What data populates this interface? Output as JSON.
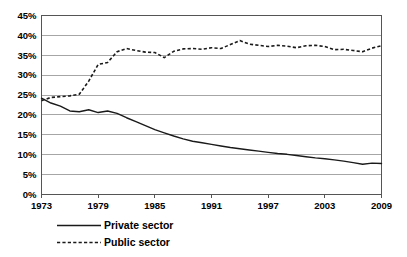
{
  "chart_data": {
    "type": "line",
    "title": "",
    "subtitle": "",
    "xlabel": "",
    "ylabel": "",
    "xlim": [
      1973,
      2009
    ],
    "ylim": [
      0,
      45
    ],
    "grid": "horizontal",
    "legend_position": "bottom-left",
    "y_ticks": [
      0,
      5,
      10,
      15,
      20,
      25,
      30,
      35,
      40,
      45
    ],
    "y_tick_labels": [
      "0%",
      "5%",
      "10%",
      "15%",
      "20%",
      "25%",
      "30%",
      "35%",
      "40%",
      "45%"
    ],
    "x_ticks": [
      1973,
      1979,
      1985,
      1991,
      1997,
      2003,
      2009
    ],
    "x_tick_labels": [
      "1973",
      "1979",
      "1985",
      "1991",
      "1997",
      "2003",
      "2009"
    ],
    "x": [
      1973,
      1974,
      1975,
      1976,
      1977,
      1978,
      1979,
      1980,
      1981,
      1982,
      1983,
      1984,
      1985,
      1986,
      1987,
      1988,
      1989,
      1990,
      1991,
      1992,
      1993,
      1994,
      1995,
      1996,
      1997,
      1998,
      1999,
      2000,
      2001,
      2002,
      2003,
      2004,
      2005,
      2006,
      2007,
      2008,
      2009
    ],
    "series": [
      {
        "name": "Private sector",
        "style": "solid",
        "color": "#1a1a1a",
        "values": [
          24.2,
          23.0,
          22.2,
          21.0,
          20.8,
          21.3,
          20.6,
          21.0,
          20.4,
          19.3,
          18.3,
          17.3,
          16.3,
          15.5,
          14.7,
          14.0,
          13.4,
          13.0,
          12.6,
          12.2,
          11.8,
          11.5,
          11.2,
          10.9,
          10.6,
          10.3,
          10.1,
          9.8,
          9.5,
          9.2,
          9.0,
          8.7,
          8.4,
          8.0,
          7.6,
          7.9,
          7.8
        ]
      },
      {
        "name": "Public sector",
        "style": "dashed",
        "color": "#1a1a1a",
        "values": [
          23.6,
          24.4,
          24.6,
          24.8,
          25.2,
          28.5,
          32.7,
          33.2,
          35.9,
          36.7,
          36.2,
          35.8,
          35.7,
          34.4,
          36.0,
          36.6,
          36.7,
          36.5,
          36.9,
          36.7,
          37.7,
          38.7,
          37.8,
          37.5,
          37.2,
          37.5,
          37.3,
          36.9,
          37.4,
          37.5,
          37.2,
          36.4,
          36.5,
          36.2,
          35.9,
          36.8,
          37.4
        ]
      }
    ]
  },
  "legend": {
    "items": [
      {
        "label": "Private sector",
        "style": "solid"
      },
      {
        "label": "Public sector",
        "style": "dashed"
      }
    ]
  }
}
